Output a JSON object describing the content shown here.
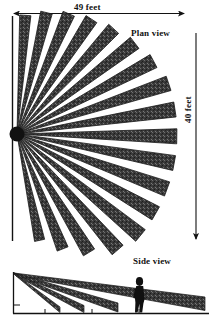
{
  "figure": {
    "type": "technical-diagram",
    "background_color": "#ffffff",
    "ink_color": "#1a1a1a",
    "blade_fill": "#3d3d3d"
  },
  "labels": {
    "top_dimension": "49 feet",
    "right_dimension": "40 feet",
    "plan_view": "Plan view",
    "side_view": "Side view"
  },
  "plan_view": {
    "title": "Plan view",
    "width_label": "49 feet",
    "height_label": "40 feet",
    "blade_count": 18,
    "apex": {
      "x": 17,
      "y": 134
    },
    "radius": 160,
    "angle_start_deg": -78,
    "angle_end_deg": 86,
    "blade_half_width_deg": 2.7
  },
  "side_view": {
    "title": "Side view",
    "apex": {
      "x": 14,
      "y": 273
    },
    "baseline_y": 313,
    "ramp_tip_x": 205,
    "blade_count": 4,
    "figure_present": true,
    "figure_x": 138
  },
  "chart_data": {
    "type": "diagram",
    "annotations": [
      "49 feet",
      "40 feet",
      "Plan view",
      "Side view"
    ],
    "dimensions": {
      "width_feet": 49,
      "height_feet": 40
    }
  }
}
